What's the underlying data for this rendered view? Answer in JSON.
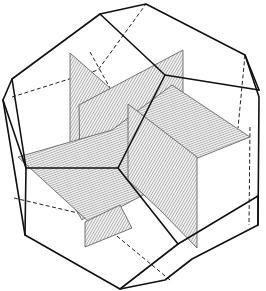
{
  "figure": {
    "colors": {
      "edge": "#111111",
      "hidden_edge": "#222222",
      "plane_hatch": "#777777",
      "background": "#ffffff"
    },
    "planes": [
      {
        "name": "horizontal-plane",
        "hatch": "horizontal"
      },
      {
        "name": "vertical-plane-left",
        "hatch": "diagonal"
      },
      {
        "name": "vertical-plane-right",
        "hatch": "diagonal"
      }
    ]
  }
}
